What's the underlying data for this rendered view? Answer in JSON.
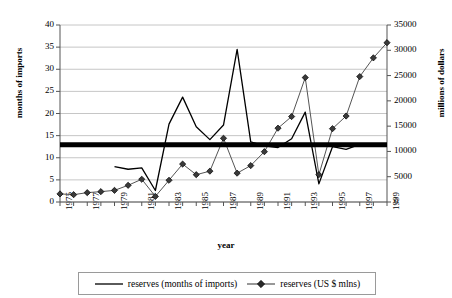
{
  "chart_data": {
    "type": "line",
    "title": "",
    "xlabel": "year",
    "ylabel": "months of imports",
    "y2label": "millions of dollars",
    "grid": true,
    "legend_position": "bottom",
    "x": [
      1975,
      1976,
      1977,
      1978,
      1979,
      1980,
      1981,
      1982,
      1983,
      1984,
      1985,
      1986,
      1987,
      1988,
      1989,
      1990,
      1991,
      1992,
      1993,
      1994,
      1995,
      1996,
      1997,
      1998,
      1999
    ],
    "xtick_labels": [
      "1975",
      "1977",
      "1979",
      "1981",
      "1983",
      "1985",
      "1987",
      "1989",
      "1991",
      "1993",
      "1995",
      "1997",
      "1999"
    ],
    "xtick_years": [
      1975,
      1977,
      1979,
      1981,
      1983,
      1985,
      1987,
      1989,
      1991,
      1993,
      1995,
      1997,
      1999
    ],
    "ylim": [
      0,
      40
    ],
    "yticks": [
      0,
      5,
      10,
      15,
      20,
      25,
      30,
      35,
      40
    ],
    "ytick_labels": [
      "0",
      "5",
      "10",
      "15",
      "20",
      "25",
      "30",
      "35",
      "40"
    ],
    "y2lim": [
      0,
      35000
    ],
    "y2ticks": [
      0,
      5000,
      10000,
      15000,
      20000,
      25000,
      30000,
      35000
    ],
    "y2tick_labels": [
      "0",
      "5000",
      "10000",
      "15000",
      "20000",
      "25000",
      "30000",
      "35000"
    ],
    "series": [
      {
        "name": "reserves (months of imports)",
        "axis": "left",
        "style": "line",
        "color": "#000000",
        "marker": "none",
        "x": [
          1979,
          1980,
          1981,
          1982,
          1983,
          1984,
          1985,
          1986,
          1987,
          1988,
          1989,
          1990,
          1991,
          1992,
          1993,
          1994,
          1995,
          1996,
          1997,
          1998,
          1999
        ],
        "values": [
          8.0,
          7.4,
          7.7,
          2.6,
          17.6,
          23.7,
          17.0,
          14.1,
          17.4,
          34.5,
          13.6,
          12.7,
          12.3,
          14.3,
          20.3,
          4.1,
          12.5,
          11.9,
          13.0,
          13.0,
          13.0
        ]
      },
      {
        "name": "reserves (US $ mlns)",
        "axis": "right",
        "style": "line+marker",
        "color": "#555555",
        "marker": "diamond",
        "x": [
          1975,
          1976,
          1977,
          1978,
          1979,
          1980,
          1981,
          1982,
          1983,
          1984,
          1985,
          1986,
          1987,
          1988,
          1989,
          1990,
          1991,
          1992,
          1993,
          1994,
          1995,
          1996,
          1997,
          1998,
          1999
        ],
        "values": [
          1600,
          1450,
          1850,
          2050,
          2300,
          3300,
          4500,
          1100,
          4300,
          7500,
          5400,
          6100,
          12600,
          5700,
          7200,
          9950,
          14600,
          16900,
          24600,
          5400,
          14500,
          17000,
          24800,
          28500,
          31500
        ]
      },
      {
        "name": "reference-level-band",
        "axis": "left",
        "style": "thick-band",
        "color": "#000000",
        "value": 12.95,
        "x_start": 1975,
        "x_end": 1999
      }
    ]
  },
  "legend": {
    "items": [
      {
        "label": "reserves (months of imports)",
        "marker": "line",
        "color": "#000000"
      },
      {
        "label": "reserves (US $ mlns)",
        "marker": "diamond-line",
        "color": "#444444"
      }
    ]
  }
}
